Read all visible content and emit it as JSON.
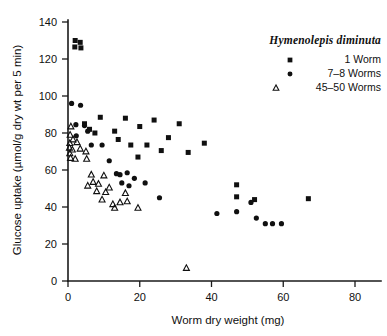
{
  "chart_data": {
    "type": "scatter",
    "title": "",
    "xlabel": "Worm dry weight (mg)",
    "ylabel": "Glucose uptake (µmol/g dry wt per 5 min)",
    "xlim": [
      0,
      87
    ],
    "ylim": [
      0,
      145
    ],
    "xticks": [
      0,
      20,
      40,
      60,
      80
    ],
    "yticks": [
      0,
      20,
      40,
      60,
      80,
      100,
      120,
      140
    ],
    "xtick_labels": [
      "0",
      "20",
      "40",
      "60",
      "80"
    ],
    "ytick_labels": [
      "0",
      "20",
      "40",
      "60",
      "80",
      "100",
      "120",
      "140"
    ],
    "grid": false,
    "legend_position": "top-right",
    "legend_title": "Hymenolepis diminuta",
    "series": [
      {
        "name": "1 Worm",
        "marker": "square",
        "color": "#101010",
        "points": [
          [
            2.0,
            130.0
          ],
          [
            3.4,
            129.0
          ],
          [
            1.9,
            126.5
          ],
          [
            3.6,
            126.0
          ],
          [
            4.6,
            85.0
          ],
          [
            6.0,
            82.0
          ],
          [
            9.0,
            88.5
          ],
          [
            7.5,
            80.0
          ],
          [
            16.0,
            88.0
          ],
          [
            13.0,
            81.0
          ],
          [
            24.0,
            87.0
          ],
          [
            20.0,
            83.5
          ],
          [
            14.0,
            76.5
          ],
          [
            31.0,
            85.0
          ],
          [
            28.0,
            77.5
          ],
          [
            38.0,
            74.5
          ],
          [
            17.5,
            73.5
          ],
          [
            22.0,
            73.5
          ],
          [
            26.0,
            70.5
          ],
          [
            33.5,
            69.5
          ],
          [
            19.5,
            67.0
          ],
          [
            47.0,
            52.0
          ],
          [
            47.0,
            45.5
          ],
          [
            52.0,
            44.0
          ],
          [
            67.0,
            44.5
          ]
        ]
      },
      {
        "name": "7–8 Worms",
        "marker": "circle",
        "color": "#101010",
        "points": [
          [
            1.0,
            96.0
          ],
          [
            3.5,
            95.0
          ],
          [
            2.2,
            84.5
          ],
          [
            4.6,
            84.0
          ],
          [
            5.5,
            81.0
          ],
          [
            2.3,
            78.5
          ],
          [
            6.5,
            73.5
          ],
          [
            9.5,
            73.5
          ],
          [
            11.5,
            65.0
          ],
          [
            13.5,
            58.0
          ],
          [
            14.5,
            57.5
          ],
          [
            16.5,
            58.5
          ],
          [
            18.5,
            55.5
          ],
          [
            15.0,
            53.0
          ],
          [
            17.0,
            51.5
          ],
          [
            21.5,
            53.0
          ],
          [
            25.5,
            45.0
          ],
          [
            47.0,
            37.5
          ],
          [
            51.0,
            42.5
          ],
          [
            52.5,
            34.0
          ],
          [
            55.0,
            31.0
          ],
          [
            57.0,
            31.0
          ],
          [
            59.5,
            31.0
          ],
          [
            41.5,
            36.5
          ]
        ]
      },
      {
        "name": "45–50 Worms",
        "marker": "triangle",
        "color": "#101010",
        "points": [
          [
            0.8,
            83.5
          ],
          [
            0.6,
            79.0
          ],
          [
            1.4,
            76.5
          ],
          [
            0.5,
            74.5
          ],
          [
            2.5,
            75.0
          ],
          [
            0.4,
            72.0
          ],
          [
            1.2,
            71.0
          ],
          [
            3.4,
            71.5
          ],
          [
            0.5,
            69.0
          ],
          [
            0.7,
            66.5
          ],
          [
            2.0,
            66.0
          ],
          [
            5.0,
            70.0
          ],
          [
            5.2,
            66.0
          ],
          [
            6.5,
            57.5
          ],
          [
            10.0,
            57.0
          ],
          [
            7.0,
            53.5
          ],
          [
            8.5,
            52.5
          ],
          [
            5.5,
            51.5
          ],
          [
            8.0,
            48.5
          ],
          [
            10.5,
            48.0
          ],
          [
            11.5,
            50.5
          ],
          [
            9.5,
            44.0
          ],
          [
            16.0,
            47.5
          ],
          [
            12.5,
            41.5
          ],
          [
            14.5,
            42.5
          ],
          [
            16.5,
            43.0
          ],
          [
            13.0,
            39.5
          ],
          [
            19.5,
            39.5
          ],
          [
            33.0,
            7.0
          ]
        ]
      }
    ]
  },
  "legend": {
    "title": "Hymenolepis diminuta",
    "items": [
      {
        "marker": "square",
        "label": "1 Worm"
      },
      {
        "marker": "circle",
        "label": "7–8 Worms"
      },
      {
        "marker": "triangle",
        "label": "45–50 Worms"
      }
    ]
  }
}
